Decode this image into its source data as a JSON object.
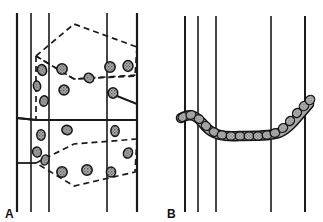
{
  "figure": {
    "title": "",
    "background_color": "#ffffff",
    "width": 323,
    "height": 222,
    "panels": [
      {
        "id": "A",
        "label": "A",
        "description": "Schematic of hexagonal cell array with vertical fibre lines and dispersed stippled granules; central hexagon drawn with solid outline, neighbouring hexagons dashed."
      },
      {
        "id": "B",
        "label": "B",
        "description": "Schematic of vertical fibre lines crossed by a single curved chain of stippled granules forming a shallow U shape."
      }
    ]
  },
  "style": {
    "line_color": "#1a1a1a",
    "dashed_color": "#1a1a1a",
    "granule_fill": "#9a9a9a",
    "granule_stroke": "#141414",
    "chain_fill": "#a8a8a8",
    "chain_stroke": "#141414",
    "label_color": "#111111"
  },
  "panel_a": {
    "label": "A",
    "vertical_lines": [
      {
        "x": 17,
        "y1": 13,
        "y2": 212,
        "width": 2.2
      },
      {
        "x": 31,
        "y1": 13,
        "y2": 212,
        "width": 1.6
      },
      {
        "x": 49,
        "y1": 13,
        "y2": 212,
        "width": 1.6
      },
      {
        "x": 107,
        "y1": 13,
        "y2": 212,
        "width": 1.6
      },
      {
        "x": 137,
        "y1": 13,
        "y2": 212,
        "width": 2.2
      }
    ],
    "hexagons": [
      {
        "name": "top-hexagon",
        "style": "dashed",
        "points": "36,56 74,24 137,47 135,75 74,79 36,56"
      },
      {
        "name": "middle-hexagon",
        "style": "mixed",
        "points": "36,120 36,56 74,79 137,75 137,107 74,120"
      },
      {
        "name": "bottom-hexagon",
        "style": "dashed",
        "points": "36,120 74,144 137,138 135,178 74,186 36,163"
      }
    ],
    "solid_edges": [
      {
        "name": "left-tick-upper",
        "points": "17,118 36,118"
      },
      {
        "name": "left-tick-lower",
        "points": "17,176 36,176"
      },
      {
        "name": "middle-hex-solid",
        "points": "36,120 74,120 137,120 137,107 107,92"
      }
    ],
    "granules": [
      {
        "cx": 42,
        "cy": 70,
        "rx": 4.5,
        "ry": 5.5,
        "rot": -20
      },
      {
        "cx": 37,
        "cy": 86,
        "rx": 3.6,
        "ry": 5.0,
        "rot": -10
      },
      {
        "cx": 44,
        "cy": 101,
        "rx": 4.2,
        "ry": 5.2,
        "rot": 15
      },
      {
        "cx": 62,
        "cy": 69,
        "rx": 5.2,
        "ry": 5.2,
        "rot": 0
      },
      {
        "cx": 64,
        "cy": 90,
        "rx": 5.0,
        "ry": 5.0,
        "rot": 0
      },
      {
        "cx": 89,
        "cy": 78,
        "rx": 5.0,
        "ry": 4.5,
        "rot": 35
      },
      {
        "cx": 110,
        "cy": 67,
        "rx": 5.2,
        "ry": 5.2,
        "rot": 0
      },
      {
        "cx": 128,
        "cy": 66,
        "rx": 5.0,
        "ry": 5.4,
        "rot": 0
      },
      {
        "cx": 113,
        "cy": 93,
        "rx": 4.8,
        "ry": 5.2,
        "rot": 0
      },
      {
        "cx": 67,
        "cy": 130,
        "rx": 5.2,
        "ry": 4.6,
        "rot": 10
      },
      {
        "cx": 115,
        "cy": 131,
        "rx": 4.2,
        "ry": 5.4,
        "rot": 0
      },
      {
        "cx": 41,
        "cy": 135,
        "rx": 4.2,
        "ry": 5.2,
        "rot": 0
      },
      {
        "cx": 37,
        "cy": 152,
        "rx": 4.4,
        "ry": 5.0,
        "rot": -15
      },
      {
        "cx": 45,
        "cy": 160,
        "rx": 3.8,
        "ry": 5.2,
        "rot": 20
      },
      {
        "cx": 128,
        "cy": 153,
        "rx": 4.4,
        "ry": 5.2,
        "rot": 25
      },
      {
        "cx": 62,
        "cy": 172,
        "rx": 5.2,
        "ry": 5.2,
        "rot": 0
      },
      {
        "cx": 87,
        "cy": 170,
        "rx": 5.2,
        "ry": 5.2,
        "rot": 0
      },
      {
        "cx": 111,
        "cy": 172,
        "rx": 4.6,
        "ry": 5.0,
        "rot": 0
      }
    ]
  },
  "panel_b": {
    "label": "B",
    "vertical_lines": [
      {
        "x": 24,
        "y1": 16,
        "y2": 212,
        "width": 2.0
      },
      {
        "x": 37,
        "y1": 16,
        "y2": 212,
        "width": 1.6
      },
      {
        "x": 55,
        "y1": 16,
        "y2": 212,
        "width": 1.6
      },
      {
        "x": 110,
        "y1": 16,
        "y2": 212,
        "width": 1.6
      },
      {
        "x": 144,
        "y1": 16,
        "y2": 212,
        "width": 2.0
      }
    ],
    "chain": {
      "name": "granule-chain",
      "path": "M 20,118 C 30,112 36,116 44,126 C 52,135 62,137 78,136 C 96,136 108,136 118,133 C 128,129 136,118 148,104",
      "beads": [
        {
          "cx": 22,
          "cy": 117,
          "rx": 5.0,
          "ry": 4.2,
          "rot": -30
        },
        {
          "cx": 30,
          "cy": 115,
          "rx": 5.0,
          "ry": 4.2,
          "rot": -10
        },
        {
          "cx": 38,
          "cy": 119,
          "rx": 4.8,
          "ry": 4.2,
          "rot": 25
        },
        {
          "cx": 45,
          "cy": 126,
          "rx": 4.8,
          "ry": 4.2,
          "rot": 40
        },
        {
          "cx": 53,
          "cy": 132,
          "rx": 4.8,
          "ry": 4.2,
          "rot": 25
        },
        {
          "cx": 61,
          "cy": 135,
          "rx": 4.8,
          "ry": 4.2,
          "rot": 8
        },
        {
          "cx": 70,
          "cy": 136,
          "rx": 4.8,
          "ry": 4.2,
          "rot": 0
        },
        {
          "cx": 79,
          "cy": 136,
          "rx": 4.8,
          "ry": 4.2,
          "rot": 0
        },
        {
          "cx": 88,
          "cy": 136,
          "rx": 4.8,
          "ry": 4.2,
          "rot": 0
        },
        {
          "cx": 97,
          "cy": 136,
          "rx": 4.8,
          "ry": 4.2,
          "rot": 0
        },
        {
          "cx": 106,
          "cy": 135,
          "rx": 4.8,
          "ry": 4.2,
          "rot": -5
        },
        {
          "cx": 114,
          "cy": 133,
          "rx": 4.8,
          "ry": 4.2,
          "rot": -15
        },
        {
          "cx": 122,
          "cy": 128,
          "rx": 4.8,
          "ry": 4.2,
          "rot": -35
        },
        {
          "cx": 129,
          "cy": 121,
          "rx": 4.8,
          "ry": 4.2,
          "rot": -45
        },
        {
          "cx": 136,
          "cy": 113,
          "rx": 4.8,
          "ry": 4.2,
          "rot": -45
        },
        {
          "cx": 143,
          "cy": 106,
          "rx": 5.0,
          "ry": 4.4,
          "rot": -45
        },
        {
          "cx": 149,
          "cy": 100,
          "rx": 5.0,
          "ry": 4.4,
          "rot": -45
        }
      ]
    }
  }
}
